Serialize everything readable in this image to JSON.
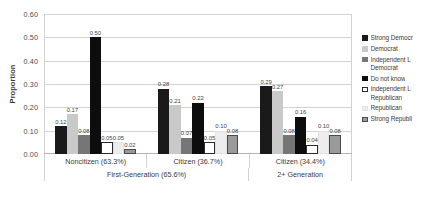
{
  "chart_data": {
    "type": "bar",
    "title": "",
    "xlabel": "",
    "ylabel": "Proportion",
    "ylim": [
      0.0,
      0.6
    ],
    "ytick_labels": [
      "0.60",
      "0.50",
      "0.40",
      "0.30",
      "0.20",
      "0.10",
      "0.00"
    ],
    "ytick_values": [
      0.6,
      0.5,
      0.4,
      0.3,
      0.2,
      0.1,
      0.0
    ],
    "grid": true,
    "legend_position": "right",
    "categories": [
      "Noncitizen (63.3%)",
      "Citizen (36.7%)",
      "Citizen (34.4%)"
    ],
    "supergroups": [
      {
        "label": "First-Generation (65.6%)",
        "span": 2
      },
      {
        "label": "2+ Generation",
        "span": 1
      }
    ],
    "series": [
      {
        "name": "Strong Democrat",
        "legend_label": "Strong Democr",
        "color": "#1a1a1a",
        "border": "#1a1a1a",
        "values": [
          0.12,
          0.28,
          0.29
        ],
        "labels": [
          "0.12",
          "0.28",
          "0.29"
        ]
      },
      {
        "name": "Democrat",
        "legend_label": "Democrat",
        "color": "#c9c9c9",
        "border": "#c9c9c9",
        "values": [
          0.17,
          0.21,
          0.27
        ],
        "labels": [
          "0.17",
          "0.21",
          "0.27"
        ]
      },
      {
        "name": "Independent Leaning Democrat",
        "legend_label": "Independent L",
        "legend_label_cont": "Democrat",
        "color": "#767676",
        "border": "#767676",
        "values": [
          0.08,
          0.07,
          0.08
        ],
        "labels": [
          "0.08",
          "0.07",
          "0.08"
        ]
      },
      {
        "name": "Do not know",
        "legend_label": "Do not know",
        "color": "#0d0d0d",
        "border": "#0d0d0d",
        "values": [
          0.5,
          0.22,
          0.16
        ],
        "labels": [
          "0.50",
          "0.22",
          "0.16"
        ]
      },
      {
        "name": "Independent Leaning Republican",
        "legend_label": "Independent L",
        "legend_label_cont": "Republican",
        "color": "#ffffff",
        "border": "#2b2b2b",
        "values": [
          0.05,
          0.05,
          0.04
        ],
        "labels": [
          "0.05",
          "0.05",
          "0.04"
        ]
      },
      {
        "name": "Republican",
        "legend_label": "Republican",
        "color": "#ededed",
        "border": "#e2e2e2",
        "values": [
          0.05,
          0.1,
          0.1
        ],
        "labels": [
          "0.05",
          "0.10",
          "0.10"
        ]
      },
      {
        "name": "Strong Republican",
        "legend_label": "Strong Republi",
        "color": "#9a9a9a",
        "border": "#4a4a4a",
        "values": [
          0.02,
          0.08,
          0.08
        ],
        "labels": [
          "0.02",
          "0.08",
          "0.08"
        ]
      }
    ]
  },
  "caption": {
    "text": ""
  }
}
